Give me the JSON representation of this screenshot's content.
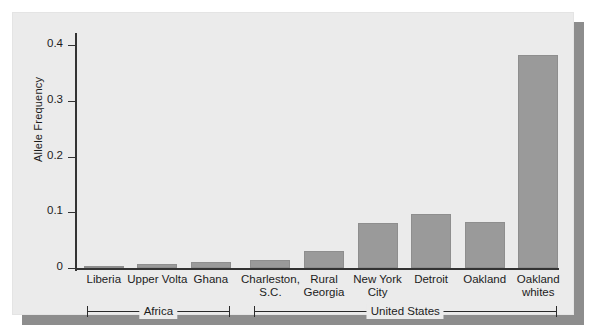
{
  "chart_data": {
    "type": "bar",
    "title": "",
    "xlabel": "",
    "ylabel": "Allele Frequency",
    "ylim": [
      0,
      0.43
    ],
    "yticks": [
      "0",
      "0.1",
      "0.2",
      "0.3",
      "0.4"
    ],
    "ytick_values": [
      0,
      0.1,
      0.2,
      0.3,
      0.4
    ],
    "grid": false,
    "legend": "none",
    "categories": [
      "Liberia",
      "Upper Volta",
      "Ghana",
      "Charleston, S.C.",
      "Rural Georgia",
      "New York City",
      "Detroit",
      "Oakland",
      "Oakland whites"
    ],
    "category_labels": [
      [
        "Liberia"
      ],
      [
        "Upper Volta"
      ],
      [
        "Ghana"
      ],
      [
        "Charleston,",
        "S.C."
      ],
      [
        "Rural",
        "Georgia"
      ],
      [
        "New York",
        "City"
      ],
      [
        "Detroit"
      ],
      [
        "Oakland"
      ],
      [
        "Oakland",
        "whites"
      ]
    ],
    "values": [
      0.002,
      0.008,
      0.012,
      0.016,
      0.032,
      0.086,
      0.104,
      0.088,
      0.41
    ],
    "groups": [
      {
        "label": "Africa",
        "members": [
          "Liberia",
          "Upper Volta",
          "Ghana"
        ]
      },
      {
        "label": "United States",
        "members": [
          "Charleston, S.C.",
          "Rural Georgia",
          "New York City",
          "Detroit",
          "Oakland",
          "Oakland whites"
        ]
      }
    ],
    "bar_color": "#9a9a9a",
    "panel_color": "#ebebeb",
    "axis_color": "#333333"
  }
}
